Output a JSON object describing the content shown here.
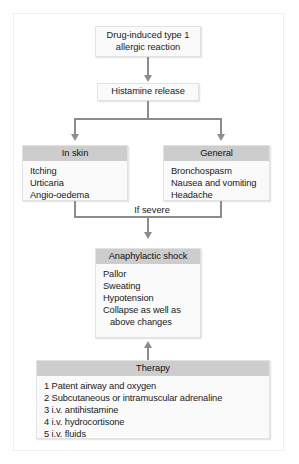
{
  "figure": {
    "kind": "flowchart",
    "title_visible": false,
    "colors": {
      "page_background": "#ffffff",
      "frame_border": "#f0f0f0",
      "box_fill": "#fafafa",
      "box_border": "#e2e2e2",
      "header_bar": "#cdcdcd",
      "connector": "#8c8c8c",
      "text": "#1a1a1a"
    }
  },
  "nodes": {
    "trigger": {
      "line1": "Drug-induced type 1",
      "line2": "allergic reaction"
    },
    "mediator": {
      "label": "Histamine release"
    },
    "in_skin": {
      "header": "In skin",
      "items": [
        "Itching",
        "Urticaria",
        "Angio-oedema"
      ]
    },
    "general": {
      "header": "General",
      "items": [
        "Bronchospasm",
        "Nausea and vomiting",
        "Headache"
      ]
    },
    "anaphylactic_shock": {
      "header": "Anaphylactic shock",
      "items": [
        "Pallor",
        "Sweating",
        "Hypotension",
        "Collapse as well as",
        "above changes"
      ]
    },
    "therapy": {
      "header": "Therapy",
      "items": [
        "1 Patent airway and oxygen",
        "2 Subcutaneous or intramuscular adrenaline",
        "3 i.v. antihistamine",
        "4 i.v. hydrocortisone",
        "5 i.v. fluids"
      ]
    }
  },
  "edges": {
    "trigger_to_mediator": {
      "label": "",
      "direction": "down"
    },
    "mediator_to_branches": {
      "label": "",
      "direction": "down"
    },
    "branches_to_shock": {
      "label": "If severe",
      "direction": "down"
    },
    "therapy_to_shock": {
      "label": "",
      "direction": "up"
    }
  }
}
